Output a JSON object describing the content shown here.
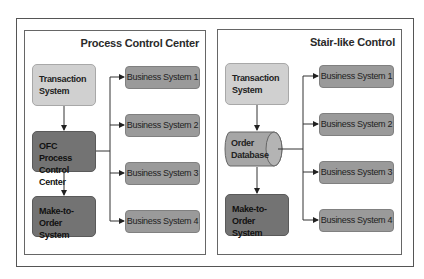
{
  "panels": [
    {
      "title": "Process Control Center",
      "nodes": {
        "source": "Transaction System",
        "hub": "OFC Process Control Center",
        "target": "Make-to-Order System"
      },
      "business_systems": [
        "Business System 1",
        "Business System 2",
        "Business System 3",
        "Business System 4"
      ]
    },
    {
      "title": "Stair-like Control",
      "nodes": {
        "source": "Transaction System",
        "hub": "Order Database",
        "target": "Make-to-Order System"
      },
      "business_systems": [
        "Business System 1",
        "Business System 2",
        "Business System 3",
        "Business System 4"
      ]
    }
  ],
  "labels": {
    "left_source_l1": "Transaction",
    "left_source_l2": "System",
    "left_hub_l1": "OFC Process",
    "left_hub_l2": "Control Center",
    "left_target_l1": "Make-to-Order",
    "left_target_l2": "System",
    "right_source_l1": "Transaction",
    "right_source_l2": "System",
    "right_hub_l1": "Order",
    "right_hub_l2": "Database",
    "right_target_l1": "Make-to-Order",
    "right_target_l2": "System"
  },
  "colors": {
    "light_box": "#d0d0d0",
    "dark_box": "#737373",
    "business_box": "#9a9a9a",
    "database": "#a6a6a6",
    "line": "#333333"
  }
}
